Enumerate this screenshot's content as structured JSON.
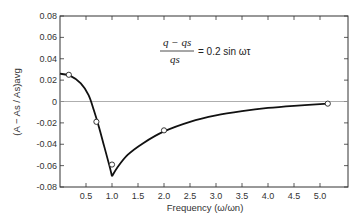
{
  "chart_data": {
    "type": "line",
    "title": "",
    "xlabel": "Frequency (ω/ωn)",
    "ylabel": "(A − As / As)avg",
    "xlim": [
      0,
      5.5
    ],
    "ylim": [
      -0.08,
      0.08
    ],
    "x_ticks": [
      0.5,
      1.0,
      1.5,
      2.0,
      2.5,
      3.0,
      3.5,
      4.0,
      4.5,
      5.0
    ],
    "x_tick_labels": [
      "0.5",
      "1.0",
      "1.5",
      "2.0",
      "2.5",
      "3.0",
      "3.5",
      "4.0",
      "4.5",
      "5.0"
    ],
    "y_ticks": [
      0.08,
      0.06,
      0.04,
      0.02,
      0,
      -0.02,
      -0.04,
      -0.06,
      -0.08
    ],
    "y_tick_labels": [
      "0.08",
      "0.06",
      "0.04",
      "0.02",
      "0",
      "-0.02",
      "-0.04",
      "-0.06",
      "-0.08"
    ],
    "grid": false,
    "zero_line": true,
    "annotation": {
      "numerator": "q − qs",
      "denominator": "qs",
      "rhs": "= 0.2 sin ωτ"
    },
    "series": [
      {
        "name": "measured",
        "style": "open-circle markers",
        "points": [
          {
            "x": 0.17,
            "y": 0.025
          },
          {
            "x": 0.7,
            "y": -0.019
          },
          {
            "x": 1.0,
            "y": -0.059
          },
          {
            "x": 2.0,
            "y": -0.027
          },
          {
            "x": 5.15,
            "y": -0.002
          }
        ]
      },
      {
        "name": "fitted curve",
        "style": "solid line",
        "points": [
          {
            "x": 0.0,
            "y": 0.026
          },
          {
            "x": 0.2,
            "y": 0.024
          },
          {
            "x": 0.4,
            "y": 0.017
          },
          {
            "x": 0.55,
            "y": 0.006
          },
          {
            "x": 0.65,
            "y": -0.008
          },
          {
            "x": 0.75,
            "y": -0.024
          },
          {
            "x": 0.85,
            "y": -0.042
          },
          {
            "x": 0.95,
            "y": -0.06
          },
          {
            "x": 1.0,
            "y": -0.07
          },
          {
            "x": 1.1,
            "y": -0.062
          },
          {
            "x": 1.3,
            "y": -0.05
          },
          {
            "x": 1.6,
            "y": -0.039
          },
          {
            "x": 2.0,
            "y": -0.028
          },
          {
            "x": 2.5,
            "y": -0.019
          },
          {
            "x": 3.0,
            "y": -0.013
          },
          {
            "x": 3.5,
            "y": -0.009
          },
          {
            "x": 4.0,
            "y": -0.006
          },
          {
            "x": 4.5,
            "y": -0.004
          },
          {
            "x": 5.15,
            "y": -0.002
          }
        ]
      }
    ]
  }
}
